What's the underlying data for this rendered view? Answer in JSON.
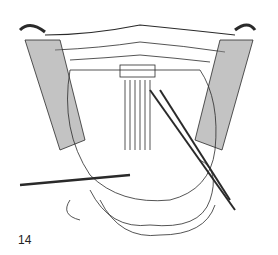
{
  "figure": {
    "label": "14"
  }
}
